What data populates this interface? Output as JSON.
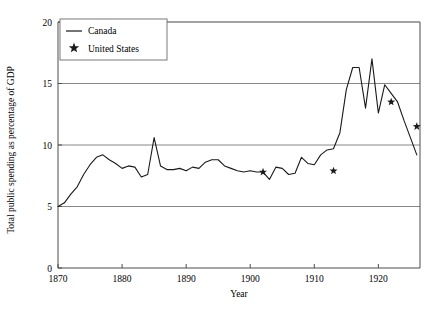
{
  "chart_data": {
    "type": "line",
    "title": "",
    "xlabel": "Year",
    "ylabel": "Total public spending as percentage of GDP",
    "xlim": [
      1870,
      1926.5
    ],
    "ylim": [
      0,
      20
    ],
    "xticks": [
      1870,
      1880,
      1890,
      1900,
      1910,
      1920
    ],
    "yticks": [
      0,
      5,
      10,
      15,
      20
    ],
    "grid": "horizontal-at-y-5-10-15-20",
    "legend": {
      "position": "top-left-inside",
      "entries": [
        {
          "name": "Canada",
          "marker": "line"
        },
        {
          "name": "United States",
          "marker": "star"
        }
      ]
    },
    "series": [
      {
        "name": "Canada",
        "marker": "line",
        "x": [
          1870,
          1871,
          1872,
          1873,
          1874,
          1875,
          1876,
          1877,
          1878,
          1879,
          1880,
          1881,
          1882,
          1883,
          1884,
          1885,
          1886,
          1887,
          1888,
          1889,
          1890,
          1891,
          1892,
          1893,
          1894,
          1895,
          1896,
          1897,
          1898,
          1899,
          1900,
          1901,
          1902,
          1903,
          1904,
          1905,
          1906,
          1907,
          1908,
          1909,
          1910,
          1911,
          1912,
          1913,
          1914,
          1915,
          1916,
          1917,
          1918,
          1919,
          1920,
          1921,
          1922,
          1923,
          1924,
          1925,
          1926
        ],
        "y": [
          5.0,
          5.3,
          6.0,
          6.6,
          7.6,
          8.4,
          9.0,
          9.2,
          8.8,
          8.5,
          8.1,
          8.3,
          8.2,
          7.4,
          7.6,
          10.6,
          8.3,
          8.0,
          8.0,
          8.1,
          7.9,
          8.2,
          8.1,
          8.6,
          8.8,
          8.8,
          8.3,
          8.1,
          7.9,
          7.8,
          7.9,
          7.8,
          7.8,
          7.2,
          8.2,
          8.1,
          7.6,
          7.7,
          9.0,
          8.5,
          8.4,
          9.2,
          9.6,
          9.7,
          11.0,
          14.5,
          16.3,
          16.3,
          13.0,
          17.0,
          12.6,
          14.9,
          14.2,
          13.5,
          12.0,
          10.6,
          9.2
        ]
      },
      {
        "name": "United States",
        "marker": "star",
        "x": [
          1902,
          1913,
          1922,
          1926
        ],
        "y": [
          7.8,
          7.9,
          13.5,
          11.5
        ]
      }
    ]
  },
  "axes": {
    "y_title": "Total public spending as percentage of GDP",
    "x_title": "Year",
    "y_tick_labels": [
      "0",
      "5",
      "10",
      "15",
      "20"
    ],
    "x_tick_labels": [
      "1870",
      "1880",
      "1890",
      "1900",
      "1910",
      "1920"
    ]
  },
  "legend": {
    "canada_label": "Canada",
    "united_states_label": "United States"
  },
  "colors": {
    "line": "#1a1a1a",
    "grid": "#7a7a7a",
    "axis": "#4d4d4d",
    "background": "#ffffff"
  }
}
